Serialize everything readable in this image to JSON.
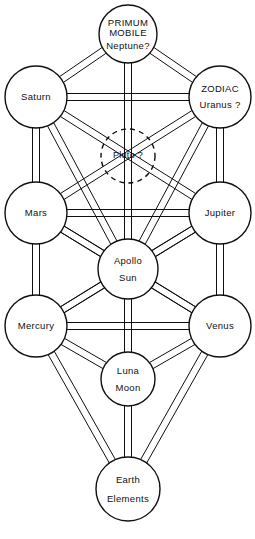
{
  "diagram": {
    "background_color": "#ffffff",
    "line_color": "#101010",
    "width": 255,
    "height": 539,
    "path_style": "double-parallel-line",
    "path_gap_px": 7,
    "nodes": [
      {
        "id": "primum-mobile",
        "cx": 128,
        "cy": 34,
        "r": 29,
        "dashed": false,
        "lines": [
          "PRIMUM",
          "MOBILE",
          "Neptune?"
        ],
        "line_sizes": [
          9.5,
          9.5,
          9.5
        ],
        "line_offsets": [
          -11,
          -1,
          12
        ]
      },
      {
        "id": "saturn",
        "cx": 36,
        "cy": 97,
        "r": 31,
        "dashed": false,
        "lines": [
          "Saturn"
        ],
        "line_sizes": [
          9.5
        ],
        "line_offsets": [
          0
        ]
      },
      {
        "id": "zodiac-uranus",
        "cx": 220,
        "cy": 97,
        "r": 31,
        "dashed": false,
        "lines": [
          "ZODIAC",
          "Uranus ?"
        ],
        "line_sizes": [
          9.5,
          9.5
        ],
        "line_offsets": [
          -8,
          8
        ]
      },
      {
        "id": "pluto",
        "cx": 128,
        "cy": 156,
        "r": 27,
        "dashed": true,
        "lines": [
          "Pluto  ?"
        ],
        "line_sizes": [
          9
        ],
        "line_offsets": [
          0
        ]
      },
      {
        "id": "mars",
        "cx": 36,
        "cy": 213,
        "r": 31,
        "dashed": false,
        "lines": [
          "Mars"
        ],
        "line_sizes": [
          9.5
        ],
        "line_offsets": [
          0
        ]
      },
      {
        "id": "jupiter",
        "cx": 220,
        "cy": 213,
        "r": 31,
        "dashed": false,
        "lines": [
          "Jupiter"
        ],
        "line_sizes": [
          9.5
        ],
        "line_offsets": [
          0
        ]
      },
      {
        "id": "apollo-sun",
        "cx": 128,
        "cy": 269,
        "r": 30,
        "dashed": false,
        "lines": [
          "Apollo",
          "Sun"
        ],
        "line_sizes": [
          9.5,
          9.5
        ],
        "line_offsets": [
          -8,
          9
        ]
      },
      {
        "id": "mercury",
        "cx": 36,
        "cy": 326,
        "r": 31,
        "dashed": false,
        "lines": [
          "Mercury"
        ],
        "line_sizes": [
          9.5
        ],
        "line_offsets": [
          0
        ]
      },
      {
        "id": "venus",
        "cx": 220,
        "cy": 326,
        "r": 31,
        "dashed": false,
        "lines": [
          "Venus"
        ],
        "line_sizes": [
          9.5
        ],
        "line_offsets": [
          0
        ]
      },
      {
        "id": "luna-moon",
        "cx": 128,
        "cy": 379,
        "r": 27,
        "dashed": false,
        "lines": [
          "Luna",
          "Moon"
        ],
        "line_sizes": [
          9.5,
          9.5
        ],
        "line_offsets": [
          -8,
          9
        ]
      },
      {
        "id": "earth-elements",
        "cx": 128,
        "cy": 489,
        "r": 32,
        "dashed": false,
        "lines": [
          "Earth",
          "Elements"
        ],
        "line_sizes": [
          9.5,
          9.5
        ],
        "line_offsets": [
          -9,
          10
        ]
      }
    ],
    "paths": [
      {
        "id": "path-primum-saturn",
        "from": "primum-mobile",
        "to": "saturn"
      },
      {
        "id": "path-primum-zodiac",
        "from": "primum-mobile",
        "to": "zodiac-uranus"
      },
      {
        "id": "path-primum-apollo",
        "from": "primum-mobile",
        "to": "apollo-sun"
      },
      {
        "id": "path-saturn-zodiac",
        "from": "saturn",
        "to": "zodiac-uranus"
      },
      {
        "id": "path-saturn-mars",
        "from": "saturn",
        "to": "mars"
      },
      {
        "id": "path-saturn-apollo",
        "from": "saturn",
        "to": "apollo-sun"
      },
      {
        "id": "path-saturn-jupiter",
        "from": "saturn",
        "to": "jupiter"
      },
      {
        "id": "path-zodiac-jupiter",
        "from": "zodiac-uranus",
        "to": "jupiter"
      },
      {
        "id": "path-zodiac-apollo",
        "from": "zodiac-uranus",
        "to": "apollo-sun"
      },
      {
        "id": "path-zodiac-mars",
        "from": "zodiac-uranus",
        "to": "mars"
      },
      {
        "id": "path-mars-jupiter",
        "from": "mars",
        "to": "jupiter"
      },
      {
        "id": "path-mars-apollo",
        "from": "mars",
        "to": "apollo-sun"
      },
      {
        "id": "path-mars-mercury",
        "from": "mars",
        "to": "mercury"
      },
      {
        "id": "path-mars-venus",
        "from": "mars",
        "to": "venus"
      },
      {
        "id": "path-jupiter-apollo",
        "from": "jupiter",
        "to": "apollo-sun"
      },
      {
        "id": "path-jupiter-venus",
        "from": "jupiter",
        "to": "venus"
      },
      {
        "id": "path-jupiter-mercury",
        "from": "jupiter",
        "to": "mercury"
      },
      {
        "id": "path-apollo-mercury",
        "from": "apollo-sun",
        "to": "mercury"
      },
      {
        "id": "path-apollo-venus",
        "from": "apollo-sun",
        "to": "venus"
      },
      {
        "id": "path-apollo-luna",
        "from": "apollo-sun",
        "to": "luna-moon"
      },
      {
        "id": "path-mercury-venus",
        "from": "mercury",
        "to": "venus"
      },
      {
        "id": "path-mercury-luna",
        "from": "mercury",
        "to": "luna-moon"
      },
      {
        "id": "path-mercury-earth",
        "from": "mercury",
        "to": "earth-elements"
      },
      {
        "id": "path-venus-luna",
        "from": "venus",
        "to": "luna-moon"
      },
      {
        "id": "path-venus-earth",
        "from": "venus",
        "to": "earth-elements"
      },
      {
        "id": "path-luna-earth",
        "from": "luna-moon",
        "to": "earth-elements"
      }
    ]
  }
}
